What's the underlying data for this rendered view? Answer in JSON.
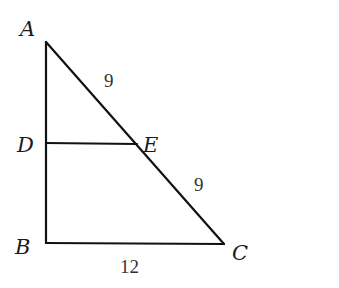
{
  "diagram": {
    "type": "geometry-triangle",
    "points": {
      "A": {
        "label": "A",
        "x": 46,
        "y": 42
      },
      "D": {
        "label": "D",
        "x": 46,
        "y": 143
      },
      "E": {
        "label": "E",
        "x": 137,
        "y": 144
      },
      "B": {
        "label": "B",
        "x": 46,
        "y": 243
      },
      "C": {
        "label": "C",
        "x": 224,
        "y": 244
      }
    },
    "segments": [
      {
        "from": "A",
        "to": "B"
      },
      {
        "from": "A",
        "to": "C"
      },
      {
        "from": "B",
        "to": "C"
      },
      {
        "from": "D",
        "to": "E"
      }
    ],
    "measures": {
      "AE": "9",
      "EC": "9",
      "BC": "12"
    },
    "colors": {
      "stroke": "#111111",
      "text": "#1a1a1a",
      "background": "#ffffff"
    }
  }
}
